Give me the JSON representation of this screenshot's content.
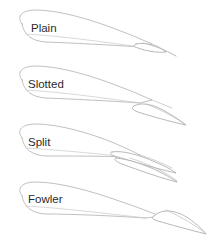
{
  "figure": {
    "colors": {
      "background": "#ffffff",
      "outline": "#b9b9b9",
      "flap_outline": "#b0b0b0",
      "chord_line": "#c9c9c9",
      "label_text": "#2b2b2b"
    },
    "items": [
      {
        "id": "plain",
        "label": "Plain",
        "label_x": 31,
        "label_y": 32,
        "description": "Plain flap hinged at the trailing edge, deflected downward"
      },
      {
        "id": "slotted",
        "label": "Slotted",
        "label_x": 28,
        "label_y": 88,
        "description": "Slotted flap separated from the wing by a slot"
      },
      {
        "id": "split",
        "label": "Split",
        "label_x": 28,
        "label_y": 146,
        "description": "Split flap where only the lower surface deflects downward"
      },
      {
        "id": "fowler",
        "label": "Fowler",
        "label_x": 28,
        "label_y": 203,
        "description": "Fowler flap that translates aft and downward"
      }
    ]
  }
}
